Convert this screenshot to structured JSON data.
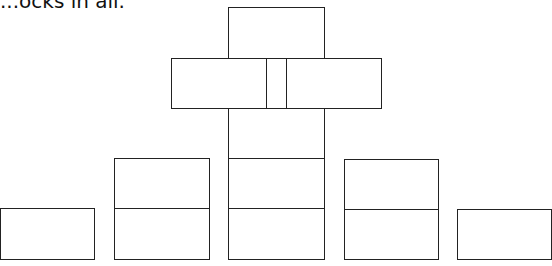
{
  "caption": "...ocks in all.",
  "diagram": {
    "stroke_color": "#222222",
    "blocks": [
      {
        "id": "top",
        "x": 228,
        "y": 7,
        "w": 97,
        "h": 52
      },
      {
        "id": "mid-left",
        "x": 171,
        "y": 58,
        "w": 96,
        "h": 51
      },
      {
        "id": "mid-narrow",
        "x": 266,
        "y": 58,
        "w": 21,
        "h": 51
      },
      {
        "id": "mid-right",
        "x": 286,
        "y": 58,
        "w": 96,
        "h": 51
      },
      {
        "id": "center-col-1",
        "x": 228,
        "y": 108,
        "w": 97,
        "h": 51
      },
      {
        "id": "center-col-2",
        "x": 228,
        "y": 158,
        "w": 97,
        "h": 51
      },
      {
        "id": "center-col-3",
        "x": 228,
        "y": 208,
        "w": 97,
        "h": 52
      },
      {
        "id": "left-stack-top",
        "x": 114,
        "y": 158,
        "w": 96,
        "h": 51
      },
      {
        "id": "left-stack-bottom",
        "x": 114,
        "y": 208,
        "w": 96,
        "h": 52
      },
      {
        "id": "right-stack-top",
        "x": 344,
        "y": 159,
        "w": 95,
        "h": 51
      },
      {
        "id": "right-stack-bottom",
        "x": 344,
        "y": 209,
        "w": 95,
        "h": 51
      },
      {
        "id": "far-left",
        "x": 0,
        "y": 208,
        "w": 95,
        "h": 52
      },
      {
        "id": "far-right",
        "x": 457,
        "y": 209,
        "w": 95,
        "h": 51
      }
    ]
  }
}
